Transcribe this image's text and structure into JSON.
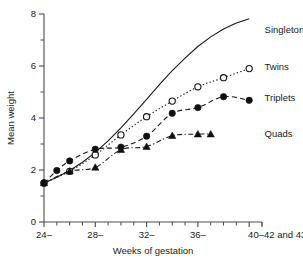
{
  "chart_data": {
    "type": "line",
    "title": "",
    "xlabel": "Weeks of gestation",
    "ylabel": "Mean weight",
    "xlim": [
      24,
      41
    ],
    "ylim": [
      0,
      8
    ],
    "grid": false,
    "legend_position": "right-inline",
    "y_ticks_major": [
      0,
      2,
      4,
      6,
      8
    ],
    "y_ticks_minor": [
      1,
      3,
      5,
      7
    ],
    "x_tick_labels": [
      "24–",
      "28–",
      "32–",
      "36–",
      "40–42 and 43"
    ],
    "x_tick_values": [
      24,
      28,
      32,
      36,
      40
    ],
    "x_ticks_minor": [
      25,
      26,
      27,
      29,
      30,
      31,
      33,
      34,
      35,
      37,
      38,
      39,
      41
    ],
    "series": [
      {
        "name": "Singletons",
        "marker": "none",
        "line_style": "solid",
        "label_x": 41.2,
        "label_y": 7.35,
        "x": [
          24,
          25,
          26,
          27,
          28,
          29,
          30,
          31,
          32,
          33,
          34,
          35,
          36,
          37,
          38,
          39,
          40
        ],
        "values": [
          1.5,
          1.72,
          1.98,
          2.3,
          2.68,
          3.12,
          3.62,
          4.16,
          4.72,
          5.28,
          5.82,
          6.3,
          6.75,
          7.12,
          7.42,
          7.65,
          7.82
        ]
      },
      {
        "name": "Twins",
        "marker": "open-circle",
        "line_style": "dotted",
        "label_x": 41.2,
        "label_y": 5.95,
        "x": [
          24,
          26,
          28,
          30,
          32,
          34,
          36,
          38,
          40
        ],
        "values": [
          1.5,
          1.95,
          2.58,
          3.35,
          4.05,
          4.65,
          5.2,
          5.55,
          5.9
        ]
      },
      {
        "name": "Triplets",
        "marker": "filled-circle",
        "line_style": "dashed",
        "label_x": 41.2,
        "label_y": 4.75,
        "x": [
          24,
          25,
          26,
          28,
          30,
          32,
          34,
          36,
          38,
          40
        ],
        "values": [
          1.5,
          1.98,
          2.35,
          2.8,
          2.88,
          3.3,
          4.18,
          4.4,
          4.82,
          4.68
        ]
      },
      {
        "name": "Quads",
        "marker": "filled-triangle",
        "line_style": "dashdot",
        "label_x": 41.2,
        "label_y": 3.35,
        "x": [
          24,
          26,
          28,
          30,
          32,
          34,
          36,
          37
        ],
        "values": [
          1.5,
          1.95,
          2.1,
          2.78,
          2.9,
          3.32,
          3.38,
          3.38
        ]
      }
    ]
  }
}
